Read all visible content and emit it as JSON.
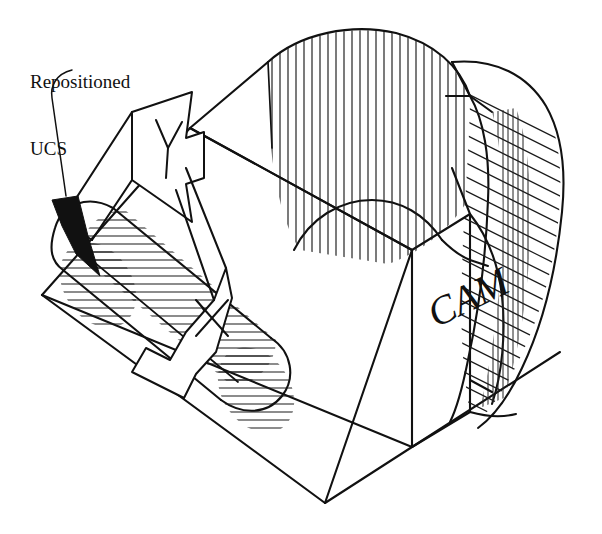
{
  "document": {
    "type": "isometric-technical-drawing",
    "subject": "3D solid model with repositioned UCS",
    "background_color": "#ffffff",
    "line_color": "#111111",
    "width": 602,
    "height": 534
  },
  "annotations": {
    "ucs_label": "Repositioned\nUCS",
    "ucs_label_line1": "Repositioned",
    "ucs_label_line2": "UCS",
    "part_text": "CAM"
  },
  "ucs_icon": {
    "y_axis_label": "Y",
    "x_axis_label": "X",
    "origin_marker": "solid-arrowhead"
  },
  "geometry": {
    "box": {
      "description": "Rectangular base block drawn in isometric projection",
      "vertices": {
        "left_corner": [
          42,
          295
        ],
        "bottom_corner": [
          325,
          503
        ],
        "front_bottom_right": [
          412,
          447
        ],
        "front_top_right": [
          412,
          250
        ],
        "mid_back": [
          190,
          128
        ],
        "top_right_far": [
          500,
          60
        ]
      }
    },
    "cylinder": {
      "description": "Hatched rounded slot (cylinder) through lower-left face",
      "axis_start": [
        80,
        255
      ],
      "axis_end": [
        275,
        385
      ],
      "radius": 45,
      "hatch": "horizontal-section-lines"
    },
    "curved_cut": {
      "description": "Curved cam profile surface with vertical hatch on front face and diagonal cross-hatch on right face",
      "front_hatch": "vertical",
      "right_hatch": "diagonal-crosshatch"
    }
  },
  "hatching": {
    "front_vertical_lines": 26,
    "cylinder_section_lines": 30,
    "right_face_diagonal_lines": 26,
    "right_face_vertical_lines": 18
  }
}
